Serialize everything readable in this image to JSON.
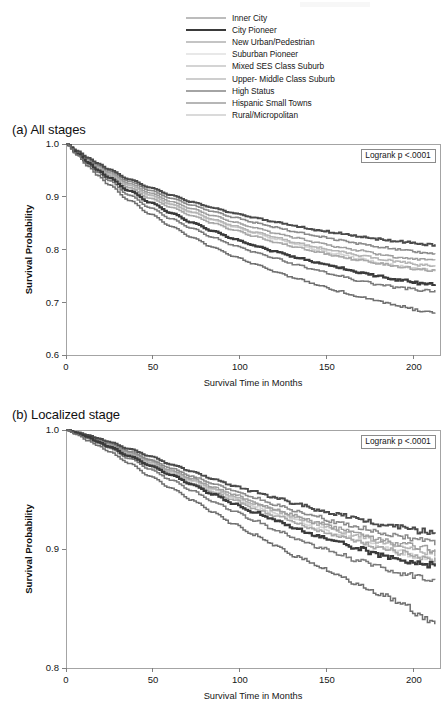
{
  "figure": {
    "axis_label_y": "Survival Probability",
    "axis_label_x": "Survival Time in Months"
  },
  "legend": {
    "items": [
      {
        "label": "Inner City",
        "color": "#7a7a7a",
        "width": 1.5
      },
      {
        "label": "City Pioneer",
        "color": "#3a3a3a",
        "width": 2.2
      },
      {
        "label": "New Urban/Pedestrian",
        "color": "#8a8a8a",
        "width": 1.5
      },
      {
        "label": "Suburban Pioneer",
        "color": "#d2d2d2",
        "width": 1.5
      },
      {
        "label": "Mixed SES Class Suburb",
        "color": "#a9a9a9",
        "width": 1.6
      },
      {
        "label": "Upper- Middle Class Suburb",
        "color": "#9e9e9e",
        "width": 1.4
      },
      {
        "label": "High Status",
        "color": "#4a4a4a",
        "width": 1.9
      },
      {
        "label": "Hispanic Small Towns",
        "color": "#6f6f6f",
        "width": 1.5
      },
      {
        "label": "Rural/Micropolitan",
        "color": "#b5b5b5",
        "width": 1.5
      }
    ]
  },
  "chart_data": [
    {
      "id": "a",
      "type": "line",
      "title": "(a) All stages",
      "xlabel": "Survival Time in Months",
      "ylabel": "Survival Probability",
      "annotation": "Logrank p <.0001",
      "xlim": [
        0,
        215
      ],
      "ylim": [
        0.6,
        1.0
      ],
      "xticks": [
        0,
        50,
        100,
        150,
        200
      ],
      "xticklabels": [
        "0",
        "50",
        "100",
        "150",
        "200"
      ],
      "yticks": [
        0.6,
        0.7,
        0.8,
        0.9,
        1.0
      ],
      "yticklabels": [
        "0.6",
        "0.7",
        "0.8",
        "0.9",
        "1.0"
      ],
      "grid": false,
      "legend_position": "above-figure",
      "x": [
        0,
        6,
        12,
        18,
        24,
        36,
        48,
        60,
        72,
        84,
        96,
        108,
        120,
        132,
        144,
        156,
        168,
        180,
        192,
        204,
        212
      ],
      "series": [
        {
          "name": "Inner City",
          "color": "#7a7a7a",
          "width": 1.5,
          "values": [
            1.0,
            0.981,
            0.962,
            0.946,
            0.931,
            0.903,
            0.879,
            0.858,
            0.84,
            0.823,
            0.808,
            0.795,
            0.783,
            0.771,
            0.76,
            0.75,
            0.741,
            0.733,
            0.727,
            0.723,
            0.722
          ]
        },
        {
          "name": "City Pioneer",
          "color": "#3a3a3a",
          "width": 2.2,
          "values": [
            1.0,
            0.982,
            0.965,
            0.95,
            0.936,
            0.911,
            0.889,
            0.869,
            0.851,
            0.835,
            0.82,
            0.807,
            0.796,
            0.785,
            0.775,
            0.766,
            0.757,
            0.749,
            0.742,
            0.736,
            0.734
          ]
        },
        {
          "name": "New Urban/Pedestrian",
          "color": "#8a8a8a",
          "width": 1.5,
          "values": [
            1.0,
            0.986,
            0.972,
            0.96,
            0.949,
            0.929,
            0.912,
            0.897,
            0.884,
            0.872,
            0.861,
            0.851,
            0.842,
            0.833,
            0.825,
            0.818,
            0.811,
            0.805,
            0.799,
            0.794,
            0.792
          ]
        },
        {
          "name": "Suburban Pioneer",
          "color": "#d2d2d2",
          "width": 1.5,
          "values": [
            1.0,
            0.984,
            0.969,
            0.956,
            0.943,
            0.921,
            0.902,
            0.885,
            0.87,
            0.856,
            0.843,
            0.831,
            0.82,
            0.81,
            0.8,
            0.791,
            0.783,
            0.775,
            0.768,
            0.762,
            0.76
          ]
        },
        {
          "name": "Mixed SES Class Suburb",
          "color": "#a9a9a9",
          "width": 1.6,
          "values": [
            1.0,
            0.983,
            0.967,
            0.953,
            0.94,
            0.917,
            0.897,
            0.88,
            0.864,
            0.85,
            0.837,
            0.825,
            0.814,
            0.804,
            0.795,
            0.787,
            0.78,
            0.773,
            0.767,
            0.762,
            0.76
          ]
        },
        {
          "name": "Upper- Middle Class Suburb",
          "color": "#9e9e9e",
          "width": 1.4,
          "values": [
            1.0,
            0.985,
            0.971,
            0.958,
            0.946,
            0.925,
            0.907,
            0.891,
            0.877,
            0.864,
            0.852,
            0.841,
            0.831,
            0.822,
            0.813,
            0.805,
            0.798,
            0.791,
            0.785,
            0.78,
            0.778
          ]
        },
        {
          "name": "High Status",
          "color": "#4a4a4a",
          "width": 1.9,
          "values": [
            1.0,
            0.987,
            0.974,
            0.963,
            0.952,
            0.933,
            0.917,
            0.903,
            0.89,
            0.879,
            0.869,
            0.86,
            0.852,
            0.844,
            0.837,
            0.831,
            0.825,
            0.82,
            0.815,
            0.811,
            0.809
          ]
        },
        {
          "name": "Hispanic Small Towns",
          "color": "#6f6f6f",
          "width": 1.5,
          "values": [
            1.0,
            0.979,
            0.958,
            0.94,
            0.923,
            0.893,
            0.867,
            0.844,
            0.823,
            0.804,
            0.787,
            0.772,
            0.758,
            0.745,
            0.733,
            0.721,
            0.711,
            0.701,
            0.692,
            0.684,
            0.681
          ]
        },
        {
          "name": "Rural/Micropolitan",
          "color": "#b5b5b5",
          "width": 1.5,
          "values": [
            1.0,
            0.984,
            0.969,
            0.956,
            0.944,
            0.922,
            0.903,
            0.886,
            0.871,
            0.857,
            0.845,
            0.833,
            0.823,
            0.813,
            0.804,
            0.796,
            0.789,
            0.782,
            0.776,
            0.771,
            0.769
          ]
        }
      ]
    },
    {
      "id": "b",
      "type": "line",
      "title": "(b) Localized stage",
      "xlabel": "Survival Time in Months",
      "ylabel": "Survival Probability",
      "annotation": "Logrank p <.0001",
      "xlim": [
        0,
        215
      ],
      "ylim": [
        0.8,
        1.0
      ],
      "xticks": [
        0,
        50,
        100,
        150,
        200
      ],
      "xticklabels": [
        "0",
        "50",
        "100",
        "150",
        "200"
      ],
      "yticks": [
        0.8,
        0.9,
        1.0
      ],
      "yticklabels": [
        "0.8",
        "0.9",
        "1.0"
      ],
      "grid": false,
      "legend_position": "above-figure",
      "x": [
        0,
        6,
        12,
        18,
        24,
        36,
        48,
        60,
        72,
        84,
        96,
        108,
        120,
        132,
        144,
        156,
        168,
        180,
        192,
        204,
        212
      ],
      "series": [
        {
          "name": "Inner City",
          "color": "#7a7a7a",
          "width": 1.5,
          "values": [
            1.0,
            0.997,
            0.993,
            0.989,
            0.985,
            0.976,
            0.967,
            0.958,
            0.949,
            0.94,
            0.932,
            0.924,
            0.916,
            0.909,
            0.902,
            0.896,
            0.89,
            0.885,
            0.88,
            0.876,
            0.874
          ]
        },
        {
          "name": "City Pioneer",
          "color": "#3a3a3a",
          "width": 2.2,
          "values": [
            1.0,
            0.997,
            0.994,
            0.99,
            0.986,
            0.978,
            0.97,
            0.962,
            0.954,
            0.946,
            0.938,
            0.931,
            0.924,
            0.917,
            0.911,
            0.905,
            0.9,
            0.895,
            0.891,
            0.888,
            0.886
          ]
        },
        {
          "name": "New Urban/Pedestrian",
          "color": "#8a8a8a",
          "width": 1.5,
          "values": [
            1.0,
            0.998,
            0.995,
            0.992,
            0.989,
            0.982,
            0.975,
            0.968,
            0.961,
            0.955,
            0.949,
            0.943,
            0.937,
            0.932,
            0.927,
            0.922,
            0.918,
            0.914,
            0.91,
            0.907,
            0.905
          ]
        },
        {
          "name": "Suburban Pioneer",
          "color": "#d2d2d2",
          "width": 1.5,
          "values": [
            1.0,
            0.997,
            0.994,
            0.991,
            0.987,
            0.98,
            0.972,
            0.964,
            0.957,
            0.95,
            0.943,
            0.936,
            0.93,
            0.924,
            0.918,
            0.912,
            0.907,
            0.902,
            0.897,
            0.893,
            0.891
          ]
        },
        {
          "name": "Mixed SES Class Suburb",
          "color": "#a9a9a9",
          "width": 1.6,
          "values": [
            1.0,
            0.997,
            0.994,
            0.99,
            0.987,
            0.979,
            0.971,
            0.963,
            0.955,
            0.948,
            0.941,
            0.934,
            0.928,
            0.922,
            0.916,
            0.911,
            0.906,
            0.901,
            0.897,
            0.893,
            0.891
          ]
        },
        {
          "name": "Upper- Middle Class Suburb",
          "color": "#9e9e9e",
          "width": 1.4,
          "values": [
            1.0,
            0.998,
            0.995,
            0.991,
            0.988,
            0.981,
            0.974,
            0.966,
            0.959,
            0.952,
            0.946,
            0.939,
            0.933,
            0.928,
            0.922,
            0.917,
            0.913,
            0.908,
            0.904,
            0.901,
            0.899
          ]
        },
        {
          "name": "High Status",
          "color": "#4a4a4a",
          "width": 1.9,
          "values": [
            1.0,
            0.998,
            0.996,
            0.993,
            0.99,
            0.984,
            0.978,
            0.971,
            0.965,
            0.959,
            0.953,
            0.948,
            0.943,
            0.938,
            0.933,
            0.929,
            0.925,
            0.921,
            0.918,
            0.915,
            0.913
          ]
        },
        {
          "name": "Hispanic Small Towns",
          "color": "#6f6f6f",
          "width": 1.5,
          "values": [
            1.0,
            0.996,
            0.991,
            0.987,
            0.982,
            0.972,
            0.961,
            0.951,
            0.941,
            0.931,
            0.921,
            0.912,
            0.903,
            0.894,
            0.886,
            0.878,
            0.87,
            0.862,
            0.855,
            0.843,
            0.838
          ]
        },
        {
          "name": "Rural/Micropolitan",
          "color": "#b5b5b5",
          "width": 1.5,
          "values": [
            1.0,
            0.997,
            0.994,
            0.991,
            0.988,
            0.98,
            0.973,
            0.965,
            0.958,
            0.951,
            0.944,
            0.938,
            0.932,
            0.926,
            0.921,
            0.915,
            0.911,
            0.906,
            0.902,
            0.898,
            0.896
          ]
        }
      ]
    }
  ]
}
